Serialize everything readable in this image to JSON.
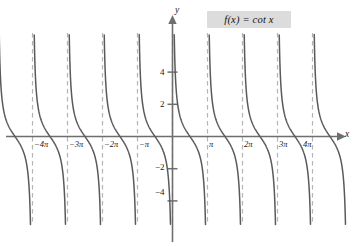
{
  "figure": {
    "function_label": "f(x) = cot x",
    "axis_x_name": "x",
    "axis_y_name": "y"
  },
  "chart_data": {
    "type": "line",
    "title": "f(x) = cot x",
    "subtitle": "",
    "xlabel": "x",
    "ylabel": "y",
    "function": "cot(x)",
    "period": "pi",
    "xlim": [
      -14.7,
      13.9
    ],
    "ylim": [
      -6.3,
      6.5
    ],
    "grid": false,
    "legend": "none",
    "x_tick_labels": [
      "−4π",
      "−3π",
      "−2π",
      "−π",
      "π",
      "2π",
      "3π",
      "4π"
    ],
    "x_tick_values": [
      -12.566,
      -9.425,
      -6.283,
      -3.142,
      3.142,
      6.283,
      9.425,
      12.566
    ],
    "y_tick_labels": [
      "4",
      "2",
      "−2",
      "−4"
    ],
    "y_tick_values": [
      4,
      2,
      -2,
      -4
    ],
    "asymptotes_label": [
      "−4π",
      "−3π",
      "−2π",
      "−π",
      "0",
      "π",
      "2π",
      "3π",
      "4π"
    ],
    "asymptotes_values": [
      -12.566,
      -9.425,
      -6.283,
      -3.142,
      0,
      3.142,
      6.283,
      9.425,
      12.566
    ],
    "branches": [
      {
        "interval": [
          -12.566,
          -9.425
        ]
      },
      {
        "interval": [
          -9.425,
          -6.283
        ]
      },
      {
        "interval": [
          -6.283,
          -3.142
        ]
      },
      {
        "interval": [
          -3.142,
          0
        ]
      },
      {
        "interval": [
          0,
          3.142
        ]
      },
      {
        "interval": [
          3.142,
          6.283
        ]
      },
      {
        "interval": [
          6.283,
          9.425
        ]
      },
      {
        "interval": [
          9.425,
          12.566
        ]
      },
      {
        "interval": [
          12.566,
          15.708
        ]
      },
      {
        "interval": [
          -15.708,
          -12.566
        ]
      }
    ],
    "colors": {
      "curve": "#5a5a5a",
      "axis": "#6e6e6e",
      "asymptote": "#b4b4b4",
      "label_box": "#dcdcdc",
      "text": "#1a1a1a",
      "background": "#ffffff"
    }
  },
  "ticks": {
    "y": [
      {
        "label": "4"
      },
      {
        "label": "2"
      },
      {
        "label": "−2"
      },
      {
        "label": "−4"
      }
    ],
    "x": [
      {
        "label": "−4π"
      },
      {
        "label": "−3π"
      },
      {
        "label": "−2π"
      },
      {
        "label": "−π"
      },
      {
        "label": "π"
      },
      {
        "label": "2π"
      },
      {
        "label": "3π"
      },
      {
        "label": "4π"
      }
    ]
  }
}
